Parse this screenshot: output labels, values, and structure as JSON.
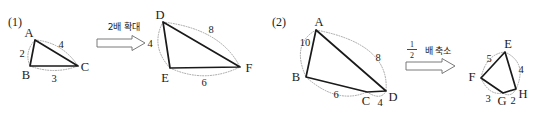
{
  "page": {
    "background": "#ffffff",
    "ink": "#1a1a1a",
    "arc_color": "#9b9b9b",
    "width": 537,
    "height": 115
  },
  "parts": [
    {
      "id": "part-1",
      "label": "(1)",
      "operation": {
        "text": "2배 확대",
        "meaning": "enlarge 2 times",
        "scale_factor": "2"
      },
      "source_shape": {
        "name": "triangle ABC",
        "vertices": [
          "A",
          "B",
          "C"
        ],
        "side_lengths": [
          "2",
          "3",
          "4"
        ],
        "sides": [
          {
            "from": "A",
            "to": "B",
            "length": "2"
          },
          {
            "from": "B",
            "to": "C",
            "length": "3"
          },
          {
            "from": "A",
            "to": "C",
            "length": "4"
          }
        ]
      },
      "target_shape": {
        "name": "triangle DEF",
        "vertices": [
          "D",
          "E",
          "F"
        ],
        "side_lengths": [
          "4",
          "6",
          "8"
        ],
        "sides": [
          {
            "from": "D",
            "to": "E",
            "length": "4"
          },
          {
            "from": "E",
            "to": "F",
            "length": "6"
          },
          {
            "from": "D",
            "to": "F",
            "length": "8"
          }
        ]
      }
    },
    {
      "id": "part-2",
      "label": "(2)",
      "operation": {
        "text": "배 축소",
        "meaning": "reduce to one half",
        "fraction_numerator": "1",
        "fraction_denominator": "2"
      },
      "source_shape": {
        "name": "quadrilateral ABCD",
        "vertices": [
          "A",
          "B",
          "C",
          "D"
        ],
        "side_lengths": [
          "10",
          "8",
          "4",
          "6"
        ],
        "sides": [
          {
            "from": "A",
            "to": "B",
            "length": "10"
          },
          {
            "from": "A",
            "to": "D",
            "length": "8"
          },
          {
            "from": "C",
            "to": "D",
            "length": "4"
          },
          {
            "from": "B",
            "to": "C",
            "length": "6"
          }
        ]
      },
      "target_shape": {
        "name": "quadrilateral EFGH",
        "vertices": [
          "E",
          "F",
          "G",
          "H"
        ],
        "side_lengths": [
          "5",
          "4",
          "2",
          "3"
        ],
        "sides": [
          {
            "from": "E",
            "to": "F",
            "length": "5"
          },
          {
            "from": "E",
            "to": "H",
            "length": "4"
          },
          {
            "from": "G",
            "to": "H",
            "length": "2"
          },
          {
            "from": "F",
            "to": "G",
            "length": "3"
          }
        ]
      }
    }
  ],
  "labels": {
    "p1_part": "(1)",
    "p1_op": "2배 확대",
    "p1_A": "A",
    "p1_B": "B",
    "p1_C": "C",
    "p1_len_AB": "2",
    "p1_len_BC": "3",
    "p1_len_AC": "4",
    "p1_D": "D",
    "p1_E": "E",
    "p1_F": "F",
    "p1_len_DE": "4",
    "p1_len_EF": "6",
    "p1_len_DF": "8",
    "p2_part": "(2)",
    "p2_op": "배 축소",
    "p2_frac_num": "1",
    "p2_frac_den": "2",
    "p2_A": "A",
    "p2_B": "B",
    "p2_C": "C",
    "p2_D": "D",
    "p2_len_AB": "10",
    "p2_len_AD": "8",
    "p2_len_BC": "6",
    "p2_len_CD": "4",
    "p2_E": "E",
    "p2_F": "F",
    "p2_G": "G",
    "p2_H": "H",
    "p2_len_EF": "5",
    "p2_len_EH": "4",
    "p2_len_FG": "3",
    "p2_len_GH": "2"
  }
}
